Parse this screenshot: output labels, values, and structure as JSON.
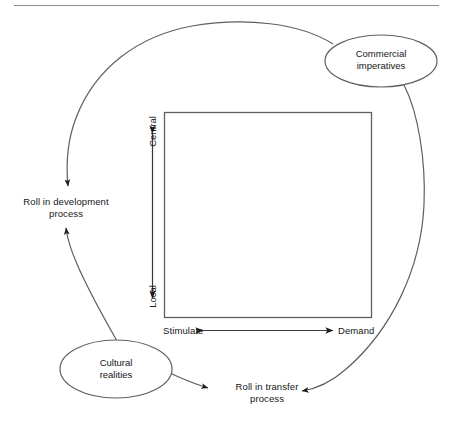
{
  "figure": {
    "type": "cycle-diagram",
    "title": "",
    "line_color": "#5f5f5f",
    "text_color": "#161616",
    "rule_color": "#8a8a8a",
    "background": "#ffffff"
  },
  "nodes": [
    {
      "id": "commercial-imperatives",
      "shape": "ellipse",
      "label": "Commercial\nimperatives"
    },
    {
      "id": "cultural-realities",
      "shape": "ellipse",
      "label": "Cultural\nrealities"
    }
  ],
  "labels": [
    {
      "id": "roll-in-development",
      "label": "Roll in development\nprocess"
    },
    {
      "id": "roll-in-transfer",
      "label": "Roll in transfer\nprocess"
    }
  ],
  "axes": {
    "vertical": {
      "top_label": "Central",
      "bottom_label": "Local",
      "arrow": "double"
    },
    "horizontal": {
      "left_label": "Stimulate",
      "right_label": "Demand",
      "arrow": "double"
    }
  },
  "matrix": {
    "shape": "square",
    "filled": false
  }
}
